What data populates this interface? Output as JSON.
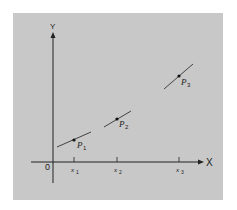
{
  "diagram": {
    "axes": {
      "x_label": "X",
      "y_label": "Y",
      "origin_label": "0"
    },
    "ticks": [
      {
        "label": "x",
        "sub": "1"
      },
      {
        "label": "x",
        "sub": "2"
      },
      {
        "label": "x",
        "sub": "3"
      }
    ],
    "points": [
      {
        "label": "P",
        "sub": "1"
      },
      {
        "label": "P",
        "sub": "2"
      },
      {
        "label": "P",
        "sub": "3"
      }
    ],
    "colors": {
      "background": "#c8c8c8",
      "ink": "#222222"
    }
  }
}
